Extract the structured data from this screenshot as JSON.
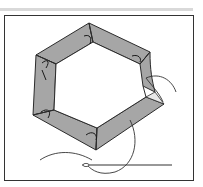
{
  "illustration": {
    "subject": "hexagon-patch-basting",
    "colors": {
      "fabric": "#a6a6a6",
      "outline": "#2b2b2b",
      "thread": "#333333",
      "background": "#ffffff",
      "top_bar": "#d9d9d9"
    }
  }
}
